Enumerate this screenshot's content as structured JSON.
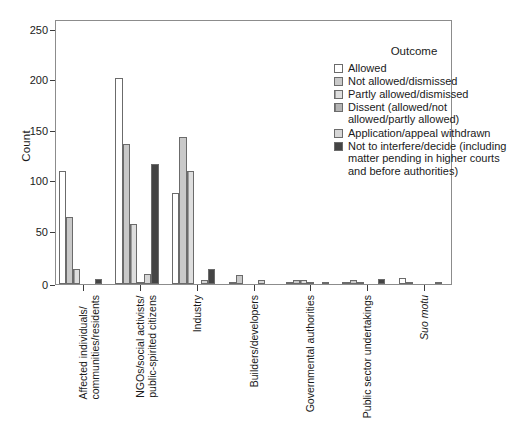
{
  "chart_data": {
    "type": "bar",
    "title": "",
    "xlabel": "",
    "ylabel": "Count",
    "ylim": [
      0,
      262
    ],
    "yticks": [
      0,
      50,
      100,
      150,
      200,
      250
    ],
    "grid": false,
    "legend_position": "top-right",
    "legend_title": "Outcome",
    "categories": [
      "Affected individuals/\ncommunities/residents",
      "NGOs/social activists/\npublic-spirited citizens",
      "Industry",
      "Builders/developers",
      "Governmental authorities",
      "Public sector undertakings",
      "Suo motu"
    ],
    "series": [
      {
        "name": "Allowed",
        "values": [
          112,
          204,
          90,
          1,
          2,
          1,
          6
        ]
      },
      {
        "name": "Not allowed/dismissed",
        "values": [
          66,
          138,
          145,
          9,
          4,
          4,
          2
        ]
      },
      {
        "name": "Partly allowed/dismissed",
        "values": [
          15,
          59,
          112,
          0,
          4,
          1,
          0
        ]
      },
      {
        "name": "Dissent (allowed/not allowed/partly allowed)",
        "values": [
          0,
          2,
          0,
          0,
          1,
          0,
          0
        ]
      },
      {
        "name": "Application/appeal withdrawn",
        "values": [
          0,
          10,
          4,
          4,
          0,
          0,
          0
        ]
      },
      {
        "name": "Not to interfere/decide (including matter pending in higher courts and before authorities)",
        "values": [
          5,
          119,
          15,
          0,
          2,
          5,
          1
        ]
      }
    ]
  },
  "axes": {
    "y_title": "Count",
    "y_tick_labels": [
      "250",
      "200",
      "150",
      "100",
      "50",
      "0"
    ],
    "x_tick_labels": [
      {
        "line1": "Affected individuals/",
        "line2": "communities/residents",
        "italic": false
      },
      {
        "line1": "NGOs/social activists/",
        "line2": "public-spirited citizens",
        "italic": false
      },
      {
        "line1": "Industry",
        "line2": "",
        "italic": false
      },
      {
        "line1": "Builders/developers",
        "line2": "",
        "italic": false
      },
      {
        "line1": "Governmental authorities",
        "line2": "",
        "italic": false
      },
      {
        "line1": "Public sector undertakings",
        "line2": "",
        "italic": false
      },
      {
        "line1": "Suo motu",
        "line2": "",
        "italic": true
      }
    ]
  },
  "legend": {
    "title": "Outcome",
    "entries": [
      {
        "label": "Allowed",
        "swatch": "swatch-allowed",
        "color": "#ffffff"
      },
      {
        "label": "Not allowed/dismissed",
        "swatch": "swatch-not-allowed",
        "color": "#c9c9c9"
      },
      {
        "label": "Partly allowed/dismissed",
        "swatch": "swatch-partly",
        "color": "#dedede"
      },
      {
        "label": "Dissent (allowed/not allowed/partly allowed)",
        "swatch": "swatch-dissent",
        "color": "#b4b4b4"
      },
      {
        "label": "Application/appeal withdrawn",
        "swatch": "swatch-withdrawn",
        "color": "#d6d6d6"
      },
      {
        "label": "Not to interfere/decide (including matter pending in higher courts and before authorities)",
        "swatch": "swatch-no-interfere",
        "color": "#444444"
      }
    ]
  },
  "style": {
    "axis_color": "#3c3c3c",
    "frame_color": "#8c8c8c",
    "bar_edge_color": "#6b6b6b",
    "background": "#ffffff"
  }
}
